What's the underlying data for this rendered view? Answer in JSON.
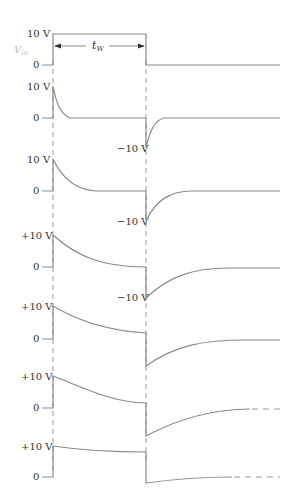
{
  "diagram": {
    "input": {
      "label": "V_in",
      "label_main": "V",
      "label_sub": "in",
      "high_label": "10 V",
      "zero_label": "0",
      "pulse_width_label": "t",
      "pulse_width_sub": "W"
    },
    "outputs": [
      {
        "high_label": "10 V",
        "zero_label": "0",
        "low_label": "−10 V",
        "decay": "very fast"
      },
      {
        "high_label": "10 V",
        "zero_label": "0",
        "low_label": "−10 V",
        "decay": "fast"
      },
      {
        "high_label": "+10 V",
        "zero_label": "0",
        "low_label": "−10 V",
        "decay": "moderate"
      },
      {
        "high_label": "+10 V",
        "zero_label": "0",
        "low_label": "",
        "decay": "slow"
      },
      {
        "high_label": "+10 V",
        "zero_label": "0",
        "low_label": "",
        "decay": "slower"
      },
      {
        "high_label": "+10 V",
        "zero_label": "0",
        "low_label": "",
        "decay": "very slow"
      }
    ],
    "colors": {
      "waveform": "#8a8a8a",
      "text": "#333333",
      "vin_label": "#bbbbbb"
    }
  }
}
